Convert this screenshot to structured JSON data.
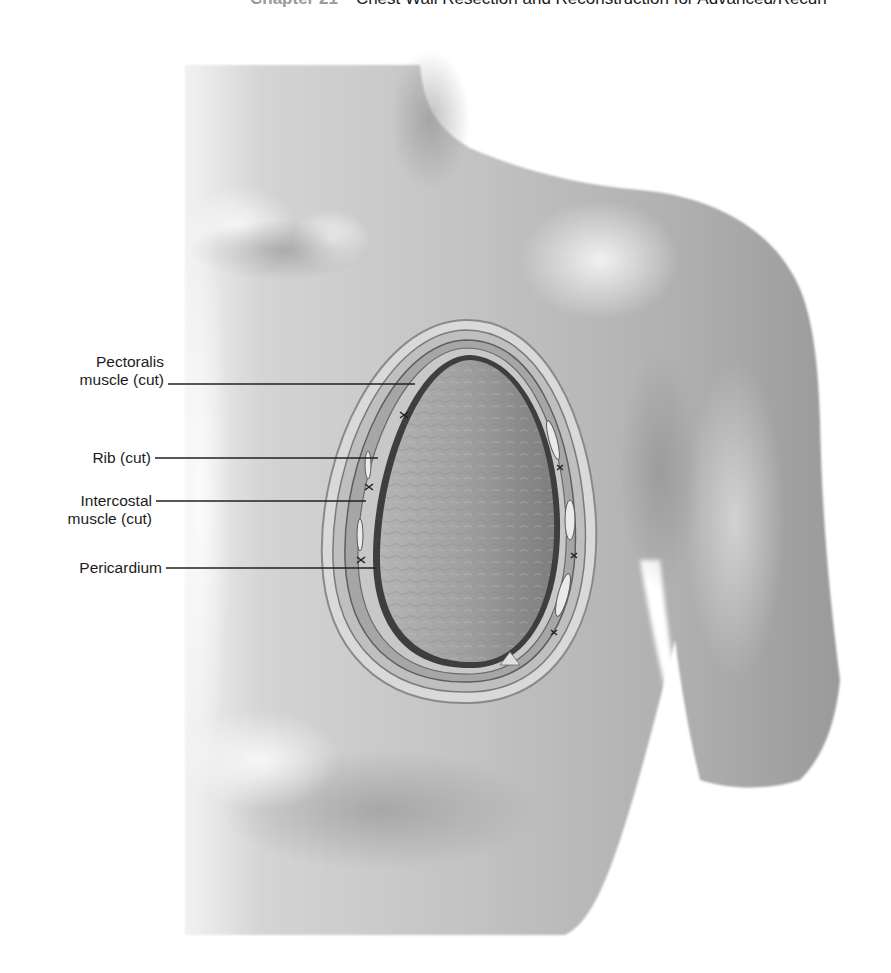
{
  "header": {
    "chapter": "Chapter 21",
    "title": "Chest Wall Resection and Reconstruction for Advanced/Recurr"
  },
  "figure": {
    "labels": [
      {
        "id": "pectoralis",
        "line1": "Pectoralis",
        "line2": "muscle (cut)"
      },
      {
        "id": "rib",
        "line1": "Rib (cut)"
      },
      {
        "id": "intercostal",
        "line1": "Intercostal",
        "line2": "muscle (cut)"
      },
      {
        "id": "pericardium",
        "line1": "Pericardium"
      }
    ]
  },
  "colors": {
    "skin_light": "#e6e6e6",
    "skin_mid": "#b9b9b9",
    "skin_dark": "#8f8f8f",
    "pericardium": "#9c9c9c",
    "text": "#1c1c1c",
    "chapter_gray": "#9a9a9a"
  }
}
